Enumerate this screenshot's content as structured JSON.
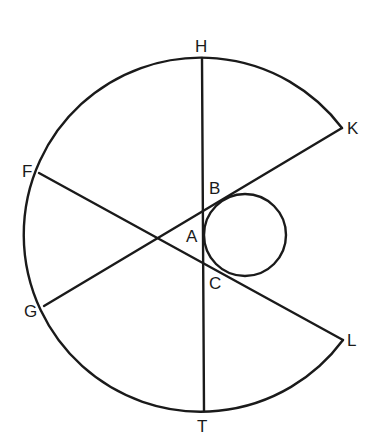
{
  "diagram": {
    "type": "geometric-construction",
    "labels": {
      "H": "H",
      "K": "K",
      "F": "F",
      "B": "B",
      "A": "A",
      "C": "C",
      "G": "G",
      "L": "L",
      "T": "T"
    },
    "outer_arc": {
      "center": [
        200,
        235
      ],
      "radius": 177,
      "from": "K",
      "to": "L",
      "via": [
        "H",
        "F",
        "G",
        "T"
      ]
    },
    "inner_circle": {
      "center": [
        245,
        235
      ],
      "radius": 41,
      "tangent_point": "A"
    },
    "segments": [
      {
        "name": "HT",
        "from": "H",
        "to": "T"
      },
      {
        "name": "FL",
        "from": "F",
        "to": "L",
        "through": "C"
      },
      {
        "name": "GK",
        "from": "G",
        "to": "K",
        "through": "B"
      }
    ],
    "colors": {
      "stroke": "#1a1a1a",
      "background": "#ffffff"
    }
  }
}
